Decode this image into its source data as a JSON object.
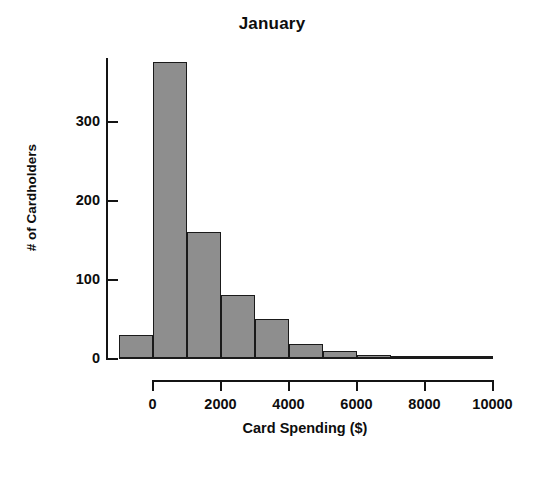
{
  "chart_data": {
    "type": "bar",
    "title": "January",
    "xlabel": "Card Spending ($)",
    "ylabel": "# of Cardholders",
    "grid": false,
    "legend": null,
    "bin_width": 1000,
    "xlim": [
      -1000,
      10000
    ],
    "ylim": [
      0,
      380
    ],
    "x_ticks": [
      0,
      2000,
      4000,
      6000,
      8000,
      10000
    ],
    "x_tick_labels": [
      "0",
      "2000",
      "4000",
      "6000",
      "8000",
      "10000"
    ],
    "y_ticks": [
      0,
      100,
      200,
      300
    ],
    "y_tick_labels": [
      "0",
      "100",
      "200",
      "300"
    ],
    "bar_color": "#8e8e8e",
    "bar_edge_color": "#1a1a1a",
    "axis_color": "#141414",
    "background": "#ffffff",
    "bins": [
      {
        "left": -1000,
        "right": 0,
        "label": "-1000 to 0",
        "value": 30
      },
      {
        "left": 0,
        "right": 1000,
        "label": "0 to 1000",
        "value": 375
      },
      {
        "left": 1000,
        "right": 2000,
        "label": "1000 to 2000",
        "value": 160
      },
      {
        "left": 2000,
        "right": 3000,
        "label": "2000 to 3000",
        "value": 80
      },
      {
        "left": 3000,
        "right": 4000,
        "label": "3000 to 4000",
        "value": 50
      },
      {
        "left": 4000,
        "right": 5000,
        "label": "4000 to 5000",
        "value": 18
      },
      {
        "left": 5000,
        "right": 6000,
        "label": "5000 to 6000",
        "value": 10
      },
      {
        "left": 6000,
        "right": 7000,
        "label": "6000 to 7000",
        "value": 4
      },
      {
        "left": 7000,
        "right": 8000,
        "label": "7000 to 8000",
        "value": 3
      },
      {
        "left": 8000,
        "right": 9000,
        "label": "8000 to 9000",
        "value": 2
      },
      {
        "left": 9000,
        "right": 10000,
        "label": "9000 to 10000",
        "value": 1
      }
    ],
    "categories": [
      "-1000 to 0",
      "0 to 1000",
      "1000 to 2000",
      "2000 to 3000",
      "3000 to 4000",
      "4000 to 5000",
      "5000 to 6000",
      "6000 to 7000",
      "7000 to 8000",
      "8000 to 9000",
      "9000 to 10000"
    ],
    "values": [
      30,
      375,
      160,
      80,
      50,
      18,
      10,
      4,
      3,
      2,
      1
    ]
  }
}
